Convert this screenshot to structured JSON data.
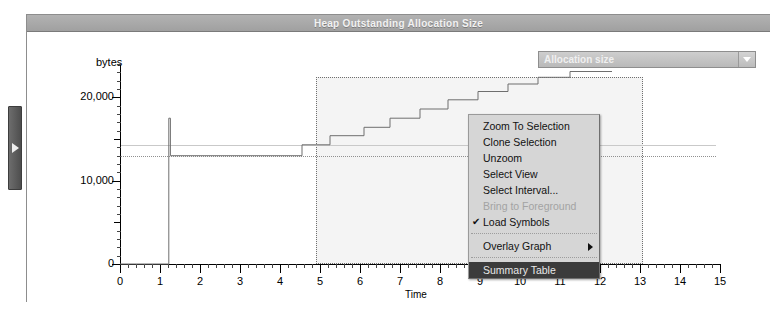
{
  "window": {
    "title": "Heap Outstanding Allocation Size"
  },
  "side_tab": {
    "icon": "expand-right-triangle-icon"
  },
  "combo": {
    "selected": "Allocation size",
    "arrow_icon": "chevron-down-icon"
  },
  "context_menu": {
    "items": [
      {
        "label": "Zoom To Selection",
        "state": "normal",
        "checked": false,
        "submenu": false
      },
      {
        "label": "Clone Selection",
        "state": "normal",
        "checked": false,
        "submenu": false
      },
      {
        "label": "Unzoom",
        "state": "normal",
        "checked": false,
        "submenu": false
      },
      {
        "label": "Select View",
        "state": "normal",
        "checked": false,
        "submenu": false
      },
      {
        "label": "Select Interval...",
        "state": "normal",
        "checked": false,
        "submenu": false
      },
      {
        "label": "Bring to Foreground",
        "state": "disabled",
        "checked": false,
        "submenu": false
      },
      {
        "label": "Load Symbols",
        "state": "normal",
        "checked": true,
        "submenu": false
      },
      {
        "label": "Overlay Graph",
        "state": "normal",
        "checked": false,
        "submenu": true
      },
      {
        "label": "Summary Table",
        "state": "highlighted",
        "checked": false,
        "submenu": false
      }
    ],
    "check_glyph": "✔"
  },
  "chart_data": {
    "type": "line",
    "title": "Heap Outstanding Allocation Size",
    "xlabel": "Time",
    "ylabel": "bytes",
    "xlim": [
      0,
      15
    ],
    "ylim": [
      0,
      24000
    ],
    "grid": false,
    "legend": false,
    "y_ticks": [
      0,
      10000,
      20000
    ],
    "y_tick_labels": [
      "0",
      "10,000",
      "20,000"
    ],
    "x_ticks": [
      0,
      1,
      2,
      3,
      4,
      5,
      6,
      7,
      8,
      9,
      10,
      11,
      12,
      13,
      14,
      15
    ],
    "x_tick_labels": [
      "0",
      "1",
      "2",
      "3",
      "4",
      "5",
      "6",
      "7",
      "8",
      "9",
      "10",
      "11",
      "12",
      "13",
      "14",
      "15"
    ],
    "minor_ticks_per_major": 5,
    "selection": {
      "x_start": 4.4,
      "x_end": 12.3,
      "y_top": 24000,
      "y_bottom": 0
    },
    "reference_lines": [
      {
        "y": 14300,
        "style": "solid"
      },
      {
        "y": 13000,
        "style": "dotted"
      }
    ],
    "series": [
      {
        "name": "Allocation size",
        "style": "step",
        "points": [
          [
            0.0,
            0
          ],
          [
            1.18,
            0
          ],
          [
            1.22,
            17500
          ],
          [
            1.26,
            13000
          ],
          [
            4.4,
            13000
          ],
          [
            4.55,
            14300
          ],
          [
            5.1,
            14300
          ],
          [
            5.25,
            15400
          ],
          [
            5.95,
            15400
          ],
          [
            6.1,
            16400
          ],
          [
            6.6,
            16400
          ],
          [
            6.75,
            17500
          ],
          [
            7.35,
            17500
          ],
          [
            7.5,
            18600
          ],
          [
            8.05,
            18600
          ],
          [
            8.2,
            19700
          ],
          [
            8.8,
            19700
          ],
          [
            8.95,
            20700
          ],
          [
            9.55,
            20700
          ],
          [
            9.7,
            21600
          ],
          [
            10.3,
            21600
          ],
          [
            10.45,
            22400
          ],
          [
            11.1,
            22400
          ],
          [
            11.25,
            23100
          ],
          [
            12.3,
            23100
          ]
        ]
      }
    ]
  }
}
